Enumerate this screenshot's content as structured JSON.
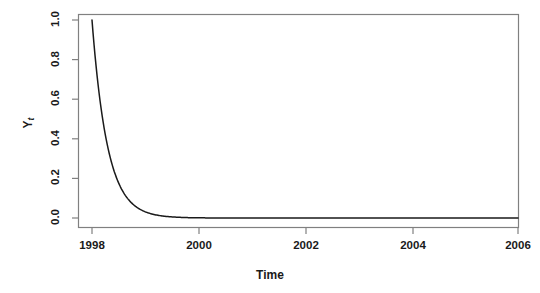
{
  "figure": {
    "background_color": "#ffffff",
    "axis_color": "#808080",
    "curve_color": "#1a1a1a",
    "text_color": "#1a1a1a"
  },
  "chart_data": {
    "type": "line",
    "title": "",
    "xlabel": "Time",
    "ylabel": "Y_t",
    "ylabel_base": "Y",
    "ylabel_sub": "t",
    "xlim": [
      1998,
      2006.4
    ],
    "ylim": [
      0.0,
      1.0
    ],
    "grid": false,
    "legend": "none",
    "xticks": [
      1998,
      2000,
      2002,
      2004,
      2006
    ],
    "xtick_labels": [
      "1998",
      "2000",
      "2002",
      "2004",
      "2006"
    ],
    "yticks": [
      0.0,
      0.2,
      0.4,
      0.6,
      0.8,
      1.0
    ],
    "ytick_labels": [
      "0.0",
      "0.2",
      "0.4",
      "0.6",
      "0.8",
      "1.0"
    ],
    "series": [
      {
        "name": "Yt",
        "description": "exponential decay",
        "decay_rate": 3.3,
        "x": [
          1998.0,
          1998.1,
          1998.2,
          1998.3,
          1998.4,
          1998.5,
          1998.6,
          1998.7,
          1998.8,
          1998.9,
          1999.0,
          1999.2,
          1999.4,
          1999.6,
          1999.8,
          2000.0,
          2000.5,
          2001.0,
          2001.5,
          2002.0,
          2003.0,
          2004.0,
          2005.0,
          2006.0,
          2006.4
        ],
        "values": [
          1.0,
          0.719,
          0.517,
          0.372,
          0.267,
          0.192,
          0.138,
          0.099,
          0.072,
          0.051,
          0.037,
          0.019,
          0.01,
          0.005,
          0.003,
          0.001,
          0.0003,
          0.0001,
          0.0,
          0.0,
          0.0,
          0.0,
          0.0,
          0.0,
          0.0
        ]
      }
    ]
  }
}
